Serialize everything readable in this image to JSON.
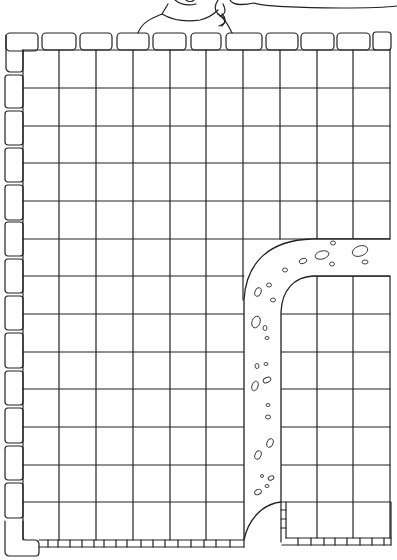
{
  "image": {
    "description": "Line-art coloring/maze page: a character peeking over a stone wall, with a speech bubble edge, a square grid enclosed by brick borders, and a cobbled path curving from the right side down to the bottom.",
    "width": 397,
    "height": 560
  },
  "colors": {
    "line": "#222222",
    "background": "#ffffff"
  },
  "grid": {
    "columns_x": [
      23,
      59,
      96,
      133,
      170,
      206,
      243,
      280,
      317,
      353,
      390
    ],
    "rows_y": [
      50,
      88,
      126,
      163,
      201,
      239,
      276,
      314,
      352,
      389,
      427,
      465,
      502,
      540
    ],
    "cell_size": 37
  },
  "wall": {
    "top_bricks": 11,
    "left_bricks": 14
  },
  "path": {
    "outer_left_x": 244,
    "inner_right_x": 281,
    "outer_top_y": 239,
    "inner_top_y": 276,
    "bottom_y": 540
  },
  "character": {
    "label": "child-peeking-over-wall"
  },
  "speech_bubble": {
    "label": "speech-bubble-edge"
  }
}
